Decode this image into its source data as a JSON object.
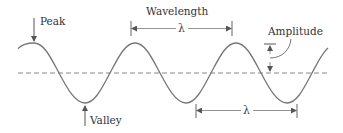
{
  "diagram": {
    "type": "wave-anatomy",
    "labels": {
      "peak": "Peak",
      "valley": "Valley",
      "wavelength": "Wavelength",
      "amplitude": "Amplitude",
      "lambda_top": "λ",
      "lambda_bottom": "λ"
    },
    "colors": {
      "wave": "#777777",
      "axis": "#888888",
      "text": "#333333",
      "arrows": "#666666",
      "background": "#ffffff"
    }
  }
}
